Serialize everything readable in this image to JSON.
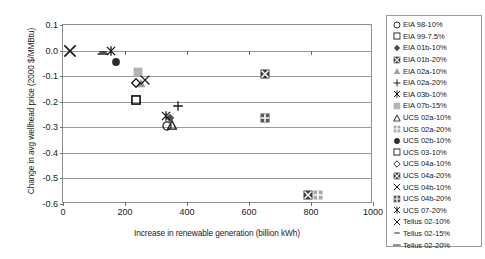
{
  "chart_data": {
    "type": "scatter",
    "title": "",
    "xlabel": "Increase in renewable generation (billion kWh)",
    "ylabel": "Change in avg wellhead price (2000 $/MMBtu)",
    "xlim": [
      0,
      1000
    ],
    "ylim": [
      -0.6,
      0.1
    ],
    "xticks": [
      0,
      200,
      400,
      600,
      800,
      1000
    ],
    "yticks": [
      0.1,
      0.0,
      -0.1,
      -0.2,
      -0.3,
      -0.4,
      -0.5,
      -0.6
    ],
    "xtick_labels": [
      "0",
      "200",
      "400",
      "600",
      "800",
      "1000"
    ],
    "ytick_labels": [
      "0.1",
      "0.0",
      "-0.1",
      "-0.2",
      "-0.3",
      "-0.4",
      "-0.5",
      "-0.6"
    ],
    "grid": "horizontal",
    "legend_position": "right-outside",
    "series": [
      {
        "name": "EIA 98-10%",
        "marker": "circle-open",
        "color": "#1a1a1a",
        "x": 335,
        "y": -0.295
      },
      {
        "name": "EIA 99-7.5%",
        "marker": "square-open",
        "color": "#1a1a1a",
        "x": 235,
        "y": -0.192
      },
      {
        "name": "EIA 01b-10%",
        "marker": "diamond-filled",
        "color": "#4d4d4d",
        "x": 346,
        "y": -0.265
      },
      {
        "name": "EIA 01b-20%",
        "marker": "square-crossed",
        "color": "#3b3b3b",
        "x": 650,
        "y": -0.092
      },
      {
        "name": "EIA 02a-10%",
        "marker": "triangle-filled",
        "color": "#9c9c9c",
        "x": 250,
        "y": -0.128
      },
      {
        "name": "EIA 02a-20%",
        "marker": "plus",
        "color": "#1a1a1a",
        "x": 371,
        "y": -0.215
      },
      {
        "name": "EIA 03b-10%",
        "marker": "asterisk",
        "color": "#1a1a1a",
        "x": 331,
        "y": -0.255
      },
      {
        "name": "EIA 07b-15%",
        "marker": "square-gray",
        "color": "#b4b4b4",
        "x": 241,
        "y": -0.085
      },
      {
        "name": "UCS 02a-10%",
        "marker": "triangle-open",
        "color": "#1a1a1a",
        "x": 352,
        "y": -0.291
      },
      {
        "name": "UCS 02a-20%",
        "marker": "square-grid",
        "color": "#a8a8a8",
        "x": 822,
        "y": -0.566
      },
      {
        "name": "UCS 02b-10%",
        "marker": "circle-filled",
        "color": "#2b2b2b",
        "x": 171,
        "y": -0.045
      },
      {
        "name": "UCS 03-10%",
        "marker": "square-open",
        "color": "#1a1a1a",
        "x": 235,
        "y": -0.192
      },
      {
        "name": "UCS 04a-10%",
        "marker": "diamond-open",
        "color": "#1a1a1a",
        "x": 236,
        "y": -0.125
      },
      {
        "name": "UCS 04a-20%",
        "marker": "square-crossed",
        "color": "#3b3b3b",
        "x": 791,
        "y": -0.566
      },
      {
        "name": "UCS 04b-10%",
        "marker": "x-cross",
        "color": "#1a1a1a",
        "x": 266,
        "y": -0.116
      },
      {
        "name": "UCS 04b-20%",
        "marker": "square-plus",
        "color": "#5a5a5a",
        "x": 651,
        "y": -0.265
      },
      {
        "name": "UCS 07-20%",
        "marker": "asterisk",
        "color": "#1a1a1a",
        "x": 156,
        "y": 0.0
      },
      {
        "name": "Tellus 02-10%",
        "marker": "x-cross",
        "color": "#1a1a1a",
        "x": 24,
        "y": 0.0
      },
      {
        "name": "Tellus 02-15%",
        "marker": "dash-short",
        "color": "#1a1a1a",
        "x": 128,
        "y": -0.004
      },
      {
        "name": "Tellus 02-20%",
        "marker": "dash-long",
        "color": "#1a1a1a",
        "x": 130,
        "y": -0.012
      }
    ]
  }
}
